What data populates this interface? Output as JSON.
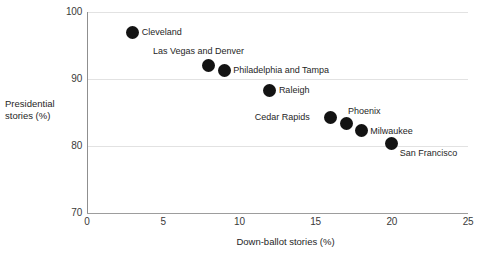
{
  "chart_data": {
    "type": "scatter",
    "title": "",
    "xlabel": "Down-ballot stories (%)",
    "ylabel": "Presidential stories  (%)",
    "ylabel_lines": [
      "Presidential",
      "stories  (%)"
    ],
    "xlim": [
      0,
      25
    ],
    "ylim": [
      70,
      100
    ],
    "xticks": [
      0,
      5,
      10,
      15,
      20,
      25
    ],
    "xtick_labels": [
      "0",
      "5",
      "10",
      "15",
      "20",
      "25"
    ],
    "yticks": [
      70,
      80,
      90,
      100
    ],
    "ytick_labels": [
      "70",
      "80",
      "90",
      "100"
    ],
    "grid": "horizontal",
    "legend": "none",
    "marker_color": "#131313",
    "gridline_color": "#e2e2e2",
    "axis_color": "#9a9a9a",
    "points": [
      {
        "label": "Cleveland",
        "x": 3,
        "y": 97.0,
        "label_pos": "right"
      },
      {
        "label": "Las Vegas and Denver",
        "x": 8,
        "y": 92.0,
        "label_pos": "above-left"
      },
      {
        "label": "Philadelphia and Tampa",
        "x": 9,
        "y": 91.3,
        "label_pos": "right"
      },
      {
        "label": "Raleigh",
        "x": 12,
        "y": 88.3,
        "label_pos": "right"
      },
      {
        "label": "Cedar Rapids",
        "x": 16,
        "y": 84.3,
        "label_pos": "left"
      },
      {
        "label": "Phoenix",
        "x": 17,
        "y": 83.3,
        "label_pos": "above-right"
      },
      {
        "label": "Milwaukee",
        "x": 18,
        "y": 82.3,
        "label_pos": "right"
      },
      {
        "label": "San Francisco",
        "x": 20,
        "y": 80.3,
        "label_pos": "below-right"
      }
    ]
  }
}
